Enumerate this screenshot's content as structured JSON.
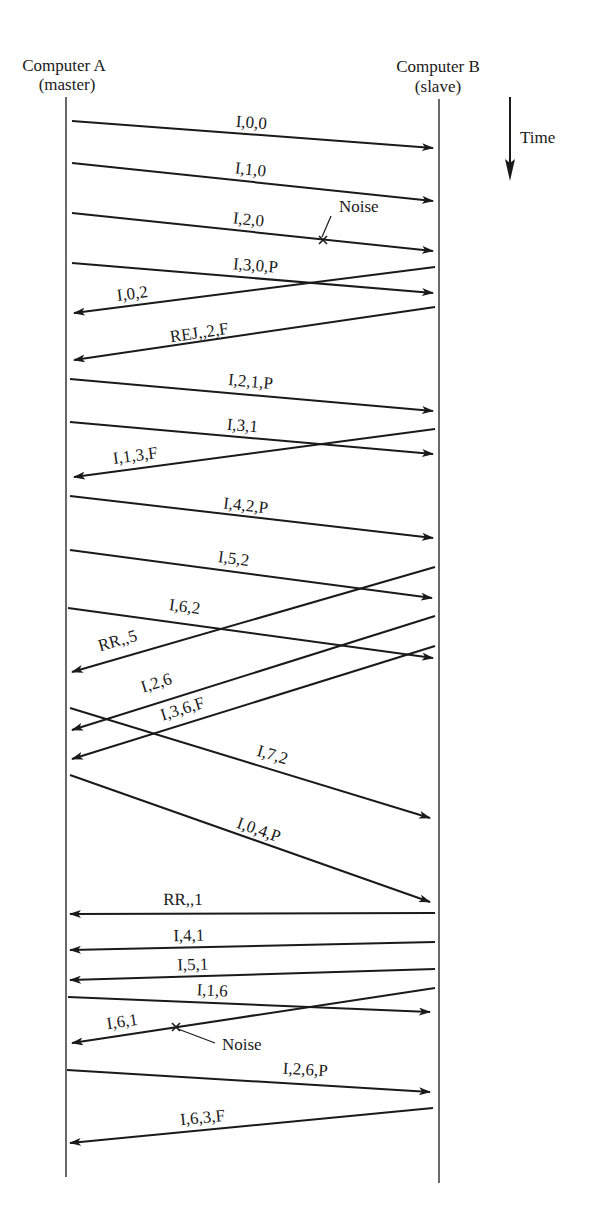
{
  "header": {
    "computer_a": {
      "name": "Computer A",
      "role": "(master)"
    },
    "computer_b": {
      "name": "Computer B",
      "role": "(slave)"
    },
    "time_label": "Time"
  },
  "lifelines": {
    "a": {
      "x": 66,
      "y1": 97,
      "y2": 1177
    },
    "b": {
      "x": 439,
      "y1": 99,
      "y2": 1183
    }
  },
  "time_arrow": {
    "x": 510,
    "y1": 97,
    "y2": 181
  },
  "messages": [
    {
      "label": "I,0,0",
      "dir": "A->B",
      "x1": 72,
      "y1": 121,
      "x2": 433,
      "y2": 148,
      "lx": 251,
      "ly": 128
    },
    {
      "label": "I,1,0",
      "dir": "A->B",
      "x1": 72,
      "y1": 163,
      "x2": 433,
      "y2": 201,
      "lx": 250,
      "ly": 175
    },
    {
      "label": "I,2,0",
      "dir": "A->B",
      "x1": 72,
      "y1": 213,
      "x2": 433,
      "y2": 251,
      "lx": 248,
      "ly": 225,
      "noise": {
        "x": 323,
        "y": 240,
        "label": "Noise",
        "tx": 339,
        "ty": 212,
        "lead": [
          322,
          237,
          331,
          216
        ]
      }
    },
    {
      "label": "I,3,0,P",
      "dir": "A->B",
      "x1": 72,
      "y1": 263,
      "x2": 433,
      "y2": 293,
      "lx": 255,
      "ly": 271
    },
    {
      "label": "I,0,2",
      "dir": "B->A",
      "x1": 435,
      "y1": 267,
      "x2": 74,
      "y2": 313,
      "lx": 133,
      "ly": 299
    },
    {
      "label": "REJ,,2,F",
      "dir": "B->A",
      "x1": 435,
      "y1": 307,
      "x2": 74,
      "y2": 360,
      "lx": 200,
      "ly": 338
    },
    {
      "label": "I,2,1,P",
      "dir": "A->B",
      "x1": 70,
      "y1": 379,
      "x2": 433,
      "y2": 411,
      "lx": 250,
      "ly": 387
    },
    {
      "label": "I,3,1",
      "dir": "A->B",
      "x1": 70,
      "y1": 422,
      "x2": 433,
      "y2": 454,
      "lx": 242,
      "ly": 431
    },
    {
      "label": "I,1,3,F",
      "dir": "B->A",
      "x1": 435,
      "y1": 429,
      "x2": 74,
      "y2": 477,
      "lx": 136,
      "ly": 461
    },
    {
      "label": "I,4,2,P",
      "dir": "A->B",
      "x1": 70,
      "y1": 496,
      "x2": 433,
      "y2": 538,
      "lx": 245,
      "ly": 511
    },
    {
      "label": "I,5,2",
      "dir": "A->B",
      "x1": 70,
      "y1": 550,
      "x2": 432,
      "y2": 598,
      "lx": 233,
      "ly": 564
    },
    {
      "label": "RR,,5",
      "dir": "B->A",
      "x1": 435,
      "y1": 567,
      "x2": 72,
      "y2": 672,
      "lx": 119,
      "ly": 646
    },
    {
      "label": "I,6,2",
      "dir": "A->B",
      "x1": 68,
      "y1": 608,
      "x2": 433,
      "y2": 658,
      "lx": 184,
      "ly": 612
    },
    {
      "label": "I,2,6",
      "dir": "B->A",
      "x1": 435,
      "y1": 616,
      "x2": 72,
      "y2": 730,
      "lx": 158,
      "ly": 688
    },
    {
      "label": "I,3,6,F",
      "dir": "B->A",
      "x1": 435,
      "y1": 646,
      "x2": 72,
      "y2": 759,
      "lx": 184,
      "ly": 714
    },
    {
      "label": "I,7,2",
      "dir": "A->B",
      "x1": 70,
      "y1": 708,
      "x2": 430,
      "y2": 818,
      "lx": 271,
      "ly": 760
    },
    {
      "label": "I,0,4,P",
      "dir": "A->B",
      "x1": 70,
      "y1": 775,
      "x2": 430,
      "y2": 902,
      "lx": 257,
      "ly": 835
    },
    {
      "label": "RR,,1",
      "dir": "B->A",
      "x1": 435,
      "y1": 913,
      "x2": 70,
      "y2": 914,
      "lx": 183,
      "ly": 905
    },
    {
      "label": "I,4,1",
      "dir": "B->A",
      "x1": 435,
      "y1": 942,
      "x2": 70,
      "y2": 950,
      "lx": 189,
      "ly": 941
    },
    {
      "label": "I,5,1",
      "dir": "B->A",
      "x1": 435,
      "y1": 969,
      "x2": 70,
      "y2": 980,
      "lx": 193,
      "ly": 970
    },
    {
      "label": "I,1,6",
      "dir": "A->B",
      "x1": 68,
      "y1": 997,
      "x2": 430,
      "y2": 1012,
      "lx": 212,
      "ly": 996
    },
    {
      "label": "I,6,1",
      "dir": "B->A",
      "x1": 435,
      "y1": 988,
      "x2": 72,
      "y2": 1043,
      "lx": 123,
      "ly": 1027,
      "noise": {
        "x": 176,
        "y": 1027,
        "label": "Noise",
        "tx": 222,
        "ty": 1050,
        "lead": [
          178,
          1029,
          215,
          1043
        ]
      }
    },
    {
      "label": "I,2,6,P",
      "dir": "A->B",
      "x1": 67,
      "y1": 1070,
      "x2": 430,
      "y2": 1092,
      "lx": 305,
      "ly": 1075
    },
    {
      "label": "I,6,3,F",
      "dir": "B->A",
      "x1": 433,
      "y1": 1108,
      "x2": 70,
      "y2": 1143,
      "lx": 203,
      "ly": 1123
    }
  ],
  "colors": {
    "ink": "#1a1a1a",
    "background": "#ffffff"
  }
}
